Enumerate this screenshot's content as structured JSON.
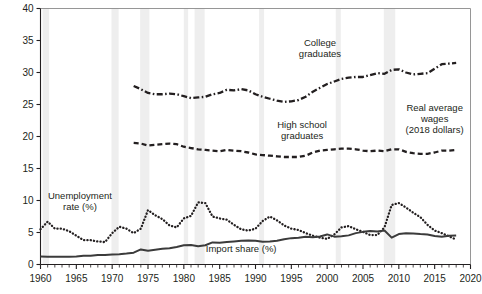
{
  "chart_data": {
    "type": "line",
    "title": "",
    "subtitle": "",
    "xlabel": "",
    "ylabel": "",
    "xlim": [
      1960,
      2020
    ],
    "ylim": [
      0,
      40
    ],
    "grid": false,
    "legend_position": "inline-annotations",
    "y_ticks": [
      0,
      5,
      10,
      15,
      20,
      25,
      30,
      35,
      40
    ],
    "y_tick_labels": [
      "0",
      "5",
      "10",
      "15",
      "20",
      "25",
      "30",
      "35",
      "40"
    ],
    "x_ticks": [
      1960,
      1965,
      1970,
      1975,
      1980,
      1985,
      1990,
      1995,
      2000,
      2005,
      2010,
      2015,
      2020
    ],
    "x_tick_labels": [
      "1960",
      "1965",
      "1970",
      "1975",
      "1980",
      "1985",
      "1990",
      "1995",
      "2000",
      "2005",
      "2010",
      "2015",
      "2020"
    ],
    "x_minor_tick_step": 1,
    "annotations": [
      {
        "id": "college-graduates",
        "text": "College graduates",
        "x": 1999.0,
        "y": 34.2
      },
      {
        "id": "high-school-graduates",
        "text": "High school graduates",
        "x": 1996.5,
        "y": 21.3
      },
      {
        "id": "real-average-wages",
        "text": "Real average wages (2018 dollars)",
        "x": 2015.0,
        "y": 24.0
      },
      {
        "id": "unemployment-rate",
        "text": "Unemployment rate (%)",
        "x": 1965.5,
        "y": 10.2
      },
      {
        "id": "import-share",
        "text": "Import share (%)",
        "x": 1988.0,
        "y": 1.9
      }
    ],
    "recession_bands": [
      {
        "start": 1960.3,
        "end": 1961.2
      },
      {
        "start": 1969.9,
        "end": 1970.9
      },
      {
        "start": 1973.9,
        "end": 1975.2
      },
      {
        "start": 1980.0,
        "end": 1980.6
      },
      {
        "start": 1981.5,
        "end": 1982.9
      },
      {
        "start": 1990.5,
        "end": 1991.2
      },
      {
        "start": 2001.2,
        "end": 2001.9
      },
      {
        "start": 2007.9,
        "end": 2009.5
      }
    ],
    "recession_band_color": "#eeeeee",
    "series": [
      {
        "name": "College graduates",
        "label": "College graduates",
        "units": "Real average hourly wages, 2018 dollars",
        "style": "dash-dot",
        "color": "#231f20",
        "x": [
          1973,
          1974,
          1975,
          1976,
          1977,
          1978,
          1979,
          1980,
          1981,
          1982,
          1983,
          1984,
          1985,
          1986,
          1987,
          1988,
          1989,
          1990,
          1991,
          1992,
          1993,
          1994,
          1995,
          1996,
          1997,
          1998,
          1999,
          2000,
          2001,
          2002,
          2003,
          2004,
          2005,
          2006,
          2007,
          2008,
          2009,
          2010,
          2011,
          2012,
          2013,
          2014,
          2015,
          2016,
          2017,
          2018
        ],
        "values": [
          27.9,
          27.4,
          26.8,
          26.6,
          26.6,
          26.7,
          26.6,
          26.3,
          26.0,
          26.1,
          26.2,
          26.6,
          26.8,
          27.3,
          27.2,
          27.4,
          27.2,
          26.6,
          26.2,
          25.9,
          25.6,
          25.4,
          25.5,
          25.7,
          26.2,
          27.0,
          27.6,
          28.2,
          28.6,
          29.0,
          29.2,
          29.3,
          29.3,
          29.6,
          29.9,
          29.8,
          30.4,
          30.5,
          30.0,
          29.7,
          29.8,
          29.9,
          30.6,
          31.3,
          31.4,
          31.5
        ]
      },
      {
        "name": "High school graduates",
        "label": "High school graduates",
        "units": "Real average hourly wages, 2018 dollars",
        "style": "dashed",
        "color": "#231f20",
        "x": [
          1973,
          1974,
          1975,
          1976,
          1977,
          1978,
          1979,
          1980,
          1981,
          1982,
          1983,
          1984,
          1985,
          1986,
          1987,
          1988,
          1989,
          1990,
          1991,
          1992,
          1993,
          1994,
          1995,
          1996,
          1997,
          1998,
          1999,
          2000,
          2001,
          2002,
          2003,
          2004,
          2005,
          2006,
          2007,
          2008,
          2009,
          2010,
          2011,
          2012,
          2013,
          2014,
          2015,
          2016,
          2017,
          2018
        ],
        "values": [
          19.0,
          18.9,
          18.6,
          18.7,
          18.8,
          18.9,
          18.8,
          18.4,
          18.2,
          18.0,
          17.9,
          17.8,
          17.7,
          17.9,
          17.8,
          17.7,
          17.5,
          17.2,
          17.1,
          17.0,
          16.9,
          16.8,
          16.8,
          16.8,
          17.0,
          17.5,
          17.8,
          17.9,
          18.0,
          18.1,
          18.1,
          18.0,
          17.8,
          17.7,
          17.8,
          17.7,
          18.0,
          18.0,
          17.6,
          17.4,
          17.3,
          17.3,
          17.5,
          17.8,
          17.8,
          17.9
        ]
      },
      {
        "name": "Unemployment rate (%)",
        "label": "Unemployment rate (%)",
        "units": "percent",
        "style": "dotted",
        "color": "#231f20",
        "x": [
          1960,
          1961,
          1962,
          1963,
          1964,
          1965,
          1966,
          1967,
          1968,
          1969,
          1970,
          1971,
          1972,
          1973,
          1974,
          1975,
          1976,
          1977,
          1978,
          1979,
          1980,
          1981,
          1982,
          1983,
          1984,
          1985,
          1986,
          1987,
          1988,
          1989,
          1990,
          1991,
          1992,
          1993,
          1994,
          1995,
          1996,
          1997,
          1998,
          1999,
          2000,
          2001,
          2002,
          2003,
          2004,
          2005,
          2006,
          2007,
          2008,
          2009,
          2010,
          2011,
          2012,
          2013,
          2014,
          2015,
          2016,
          2017,
          2018
        ],
        "values": [
          5.5,
          6.7,
          5.6,
          5.6,
          5.2,
          4.5,
          3.8,
          3.8,
          3.6,
          3.5,
          4.9,
          5.9,
          5.6,
          4.9,
          5.6,
          8.5,
          7.7,
          7.1,
          6.1,
          5.8,
          7.2,
          7.6,
          9.7,
          9.6,
          7.5,
          7.2,
          7.0,
          6.2,
          5.5,
          5.3,
          5.6,
          6.8,
          7.5,
          6.9,
          6.1,
          5.6,
          5.4,
          4.9,
          4.5,
          4.2,
          4.0,
          4.7,
          5.8,
          6.0,
          5.5,
          5.1,
          4.6,
          4.6,
          5.8,
          9.3,
          9.6,
          8.9,
          8.1,
          7.4,
          6.2,
          5.3,
          4.9,
          4.4,
          3.9
        ]
      },
      {
        "name": "Import share (%)",
        "label": "Import share (%)",
        "units": "percent of GDP",
        "style": "solid",
        "color": "#3b3b3b",
        "x": [
          1960,
          1961,
          1962,
          1963,
          1964,
          1965,
          1966,
          1967,
          1968,
          1969,
          1970,
          1971,
          1972,
          1973,
          1974,
          1975,
          1976,
          1977,
          1978,
          1979,
          1980,
          1981,
          1982,
          1983,
          1984,
          1985,
          1986,
          1987,
          1988,
          1989,
          1990,
          1991,
          1992,
          1993,
          1994,
          1995,
          1996,
          1997,
          1998,
          1999,
          2000,
          2001,
          2002,
          2003,
          2004,
          2005,
          2006,
          2007,
          2008,
          2009,
          2010,
          2011,
          2012,
          2013,
          2014,
          2015,
          2016,
          2017,
          2018
        ],
        "values": [
          1.25,
          1.22,
          1.22,
          1.22,
          1.22,
          1.26,
          1.35,
          1.35,
          1.48,
          1.5,
          1.55,
          1.62,
          1.72,
          1.85,
          2.35,
          2.15,
          2.32,
          2.45,
          2.55,
          2.75,
          3.0,
          3.05,
          2.85,
          3.0,
          3.45,
          3.4,
          3.5,
          3.6,
          3.7,
          3.75,
          3.72,
          3.55,
          3.58,
          3.72,
          3.95,
          4.12,
          4.18,
          4.32,
          4.25,
          4.38,
          4.7,
          4.35,
          4.4,
          4.55,
          4.9,
          5.1,
          5.25,
          5.15,
          5.3,
          4.2,
          4.75,
          4.9,
          4.85,
          4.75,
          4.7,
          4.45,
          4.35,
          4.5,
          4.55
        ]
      }
    ]
  }
}
